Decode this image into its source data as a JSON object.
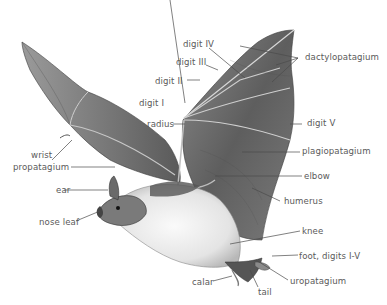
{
  "diagram": {
    "colors": {
      "label_text": "#5a5a5a",
      "leader_line": "#4a4a4a",
      "membrane": "#6e6e6e",
      "belly": "#eeeeee"
    },
    "labels": {
      "digit_iv": "digit IV",
      "digit_iii": "digit III",
      "digit_ii": "digit II",
      "digit_i": "digit I",
      "radius": "radius",
      "wrist": "wrist",
      "propatagium": "propatagium",
      "ear": "ear",
      "nose_leaf": "nose leaf",
      "dactylopatagium": "dactylopatagium",
      "digit_v": "digit V",
      "plagiopatagium": "plagiopatagium",
      "elbow": "elbow",
      "humerus": "humerus",
      "knee": "knee",
      "foot": "foot, digits I-V",
      "uropatagium": "uropatagium",
      "calar": "calar",
      "tail": "tail"
    }
  }
}
